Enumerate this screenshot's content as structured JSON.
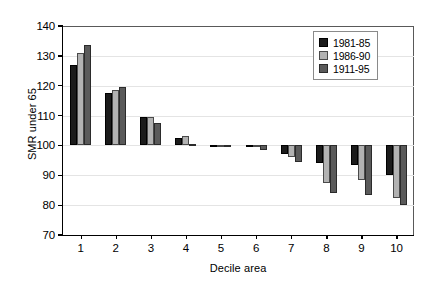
{
  "chart_data": {
    "type": "bar",
    "title": "",
    "xlabel": "Decile area",
    "ylabel": "SMR under 65",
    "ylim": [
      70,
      140
    ],
    "yticks": [
      70,
      80,
      90,
      100,
      110,
      120,
      130,
      140
    ],
    "grid": true,
    "baseline": 100,
    "legend_position": "top-right",
    "categories": [
      "1",
      "2",
      "3",
      "4",
      "5",
      "6",
      "7",
      "8",
      "9",
      "10"
    ],
    "series": [
      {
        "name": "1981-85",
        "color": "#1b1b1b",
        "values": [
          126.8,
          117.5,
          109.5,
          102.5,
          100.2,
          100.0,
          97.0,
          94.0,
          93.5,
          90.0
        ]
      },
      {
        "name": "1986-90",
        "color": "#b2b2b2",
        "values": [
          130.8,
          118.6,
          109.4,
          103.1,
          100.1,
          99.9,
          96.0,
          87.5,
          88.5,
          82.5
        ]
      },
      {
        "name": "1911-95",
        "color": "#5a5a5a",
        "values": [
          133.8,
          119.6,
          107.4,
          100.6,
          100.0,
          98.5,
          94.5,
          84.0,
          83.5,
          80.0
        ]
      }
    ]
  }
}
